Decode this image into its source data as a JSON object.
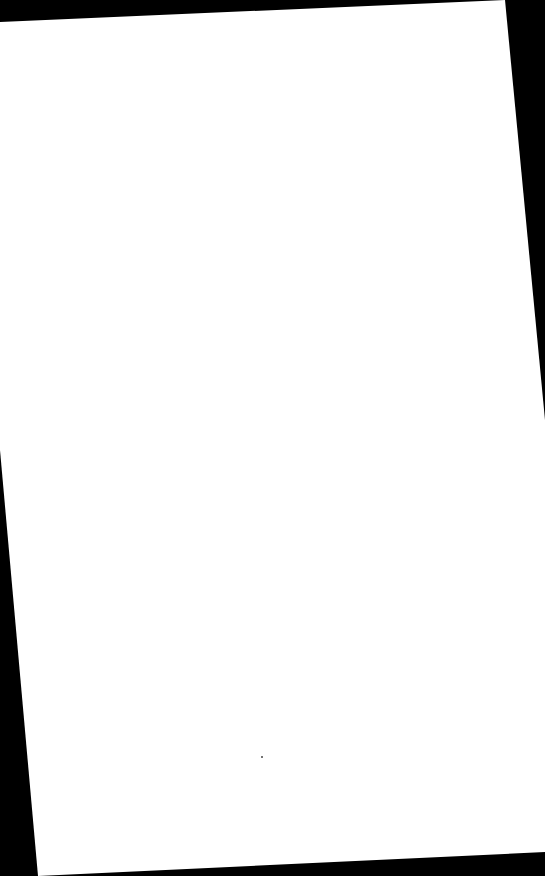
{
  "document": {
    "type": "scanned-page",
    "content": "blank page",
    "text_lines": [],
    "background_color": "#000000",
    "page_color": "#ffffff",
    "page_corners": [
      [
        0,
        22
      ],
      [
        505,
        0
      ],
      [
        545,
        420
      ],
      [
        545,
        852
      ],
      [
        38,
        876
      ],
      [
        0,
        450
      ]
    ],
    "marks": [
      {
        "kind": "speck",
        "x": 262,
        "y": 757
      }
    ]
  }
}
